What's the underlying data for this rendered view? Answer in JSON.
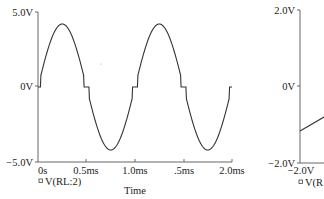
{
  "chart_data": [
    {
      "type": "line",
      "title": "",
      "xlabel": "Time",
      "ylabel": "",
      "xlim": [
        0,
        2.0
      ],
      "ylim": [
        -5.0,
        5.0
      ],
      "x_unit": "ms",
      "y_unit": "V",
      "x_ticks": [
        "0s",
        "0.5ms",
        "1.0ms",
        ".5ms",
        "2.0ms"
      ],
      "y_ticks": [
        "5.0V",
        "0V",
        "-5.0V"
      ],
      "grid": false,
      "legend": [
        "V(RL:2)"
      ],
      "legend_position": "bottom-left",
      "series": [
        {
          "name": "V(RL:2)",
          "description": "Full-wave-like sine at 1 kHz, ~4.2V peak, with small dead-zone plateaus near 0V at each zero crossing (crossover distortion)",
          "x": [
            0,
            0.02,
            0.05,
            0.25,
            0.45,
            0.48,
            0.52,
            0.55,
            0.75,
            0.95,
            0.98,
            1.02,
            1.05,
            1.25,
            1.45,
            1.48,
            1.52,
            1.55,
            1.75,
            1.95,
            1.98,
            2.0
          ],
          "values": [
            0,
            0,
            0.7,
            4.2,
            0.7,
            0,
            0,
            -0.7,
            -4.2,
            -0.7,
            0,
            0,
            0.7,
            4.2,
            0.7,
            0,
            0,
            -0.7,
            -4.2,
            -0.7,
            0,
            0.6
          ]
        }
      ]
    },
    {
      "type": "line",
      "title": "",
      "xlabel": "",
      "ylim": [
        -2.0,
        2.0
      ],
      "x_ticks": [
        "-2.0V"
      ],
      "y_ticks": [
        "2.0V",
        "0V",
        "-2.0V"
      ],
      "legend": [
        "V(R"
      ],
      "legend_position": "bottom-left",
      "partial": true,
      "series": [
        {
          "name": "V(R",
          "x": [
            -2.0,
            -1.6
          ],
          "values": [
            -1.15,
            -0.75
          ]
        }
      ]
    }
  ],
  "left": {
    "y_labels": {
      "top": "5.0V",
      "mid": "0V",
      "bottom": "-5.0V"
    },
    "x_labels": [
      "0s",
      "0.5ms",
      "1.0ms",
      ".5ms",
      "2.0ms"
    ],
    "x_title": "Time",
    "legend": "V(RL:2)",
    "legend_marker": "square-marker"
  },
  "right": {
    "y_labels": {
      "top": "2.0V",
      "mid": "0V",
      "bottom": "-2.0V"
    },
    "x_label": "-2.0V",
    "legend": "V(R",
    "legend_marker": "square-marker"
  },
  "colors": {
    "axis": "#555555",
    "trace": "#333333",
    "text": "#222222"
  }
}
